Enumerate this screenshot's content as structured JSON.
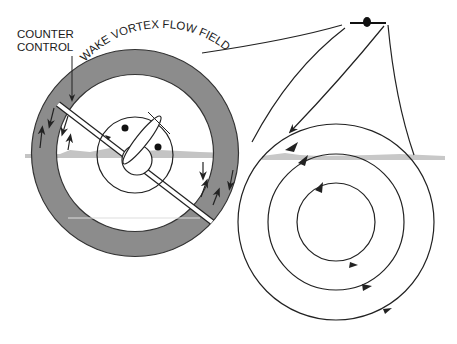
{
  "labels": {
    "counter_control_line1": "COUNTER",
    "counter_control_line2": "CONTROL",
    "wake_vortex": "WAKE VORTEX FLOW FIELD"
  },
  "colors": {
    "ring_fill": "#8c8c8c",
    "stroke": "#222222",
    "horizon": "#bdbdbd"
  }
}
